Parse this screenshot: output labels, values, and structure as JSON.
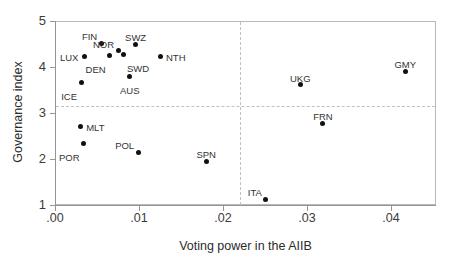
{
  "chart_data": {
    "type": "scatter",
    "title": "",
    "xlabel": "Voting power in the AIIB",
    "ylabel": "Governance index",
    "xlim": [
      0.0,
      0.0454
    ],
    "ylim": [
      1.0,
      5.0
    ],
    "grid": false,
    "legend": null,
    "xticks": [
      {
        "value": 0.0,
        "label": ".00"
      },
      {
        "value": 0.01,
        "label": ".01"
      },
      {
        "value": 0.02,
        "label": ".02"
      },
      {
        "value": 0.03,
        "label": ".03"
      },
      {
        "value": 0.04,
        "label": ".04"
      }
    ],
    "yticks": [
      {
        "value": 1,
        "label": "1"
      },
      {
        "value": 2,
        "label": "2"
      },
      {
        "value": 3,
        "label": "3"
      },
      {
        "value": 4,
        "label": "4"
      },
      {
        "value": 5,
        "label": "5"
      }
    ],
    "reference_lines": [
      {
        "orientation": "horizontal",
        "value": 3.15,
        "style": "dashed",
        "color": "#c0c0c0"
      },
      {
        "orientation": "vertical",
        "value": 0.022,
        "style": "dashed",
        "color": "#c0c0c0"
      }
    ],
    "marker_color": "#111111",
    "points": [
      {
        "label": "LUX",
        "x": 0.0035,
        "y": 4.22,
        "label_pos": "left"
      },
      {
        "label": "ICE",
        "x": 0.0031,
        "y": 3.67,
        "label_pos": "below-left"
      },
      {
        "label": "FIN",
        "x": 0.0055,
        "y": 4.52,
        "label_pos": "above-left"
      },
      {
        "label": "DEN",
        "x": 0.0065,
        "y": 4.26,
        "label_pos": "below-left"
      },
      {
        "label": "NOR",
        "x": 0.0075,
        "y": 4.35,
        "label_pos": "above-left"
      },
      {
        "label": "SWD",
        "x": 0.0081,
        "y": 4.28,
        "label_pos": "below-right"
      },
      {
        "label": "AUS",
        "x": 0.0089,
        "y": 3.8,
        "label_pos": "below"
      },
      {
        "label": "SWZ",
        "x": 0.0096,
        "y": 4.5,
        "label_pos": "above"
      },
      {
        "label": "NTH",
        "x": 0.0125,
        "y": 4.22,
        "label_pos": "right"
      },
      {
        "label": "MLT",
        "x": 0.003,
        "y": 2.7,
        "label_pos": "right"
      },
      {
        "label": "POR",
        "x": 0.0034,
        "y": 2.34,
        "label_pos": "below-left"
      },
      {
        "label": "POL",
        "x": 0.0099,
        "y": 2.15,
        "label_pos": "above-left"
      },
      {
        "label": "SPN",
        "x": 0.018,
        "y": 1.95,
        "label_pos": "above"
      },
      {
        "label": "ITA",
        "x": 0.0251,
        "y": 1.12,
        "label_pos": "above-left"
      },
      {
        "label": "UKG",
        "x": 0.0292,
        "y": 3.61,
        "label_pos": "above"
      },
      {
        "label": "FRN",
        "x": 0.0319,
        "y": 2.78,
        "label_pos": "above"
      },
      {
        "label": "GMY",
        "x": 0.0417,
        "y": 3.91,
        "label_pos": "above"
      }
    ]
  }
}
